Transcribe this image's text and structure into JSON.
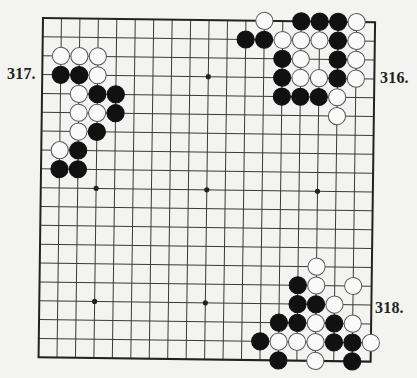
{
  "diagram": {
    "type": "go-board",
    "size": 19,
    "colors": {
      "background": "#f3f3f1",
      "line": "#3a3a3a",
      "border": "#222222",
      "black_stone": "#111111",
      "white_stone": "#fafafa",
      "white_outline": "#555555"
    },
    "hoshi": [
      [
        3,
        9
      ],
      [
        9,
        3
      ],
      [
        9,
        9
      ],
      [
        15,
        9
      ],
      [
        3,
        15
      ],
      [
        9,
        15
      ]
    ],
    "problems": [
      {
        "label": "317.",
        "position": "top-left",
        "stones": [
          {
            "c": 1,
            "r": 2,
            "color": "white"
          },
          {
            "c": 2,
            "r": 2,
            "color": "white"
          },
          {
            "c": 3,
            "r": 2,
            "color": "white"
          },
          {
            "c": 1,
            "r": 3,
            "color": "black"
          },
          {
            "c": 2,
            "r": 3,
            "color": "black"
          },
          {
            "c": 3,
            "r": 3,
            "color": "white"
          },
          {
            "c": 2,
            "r": 4,
            "color": "white"
          },
          {
            "c": 3,
            "r": 4,
            "color": "black"
          },
          {
            "c": 4,
            "r": 4,
            "color": "black"
          },
          {
            "c": 2,
            "r": 5,
            "color": "white"
          },
          {
            "c": 3,
            "r": 5,
            "color": "white"
          },
          {
            "c": 4,
            "r": 5,
            "color": "black"
          },
          {
            "c": 2,
            "r": 6,
            "color": "white"
          },
          {
            "c": 3,
            "r": 6,
            "color": "black"
          },
          {
            "c": 1,
            "r": 7,
            "color": "white"
          },
          {
            "c": 2,
            "r": 7,
            "color": "black"
          },
          {
            "c": 1,
            "r": 8,
            "color": "black"
          },
          {
            "c": 2,
            "r": 8,
            "color": "black"
          }
        ]
      },
      {
        "label": "316.",
        "position": "top-right",
        "stones": [
          {
            "c": 12,
            "r": 0,
            "color": "white"
          },
          {
            "c": 14,
            "r": 0,
            "color": "black"
          },
          {
            "c": 15,
            "r": 0,
            "color": "black"
          },
          {
            "c": 16,
            "r": 0,
            "color": "black"
          },
          {
            "c": 17,
            "r": 0,
            "color": "white"
          },
          {
            "c": 11,
            "r": 1,
            "color": "black"
          },
          {
            "c": 12,
            "r": 1,
            "color": "black"
          },
          {
            "c": 13,
            "r": 1,
            "color": "white"
          },
          {
            "c": 14,
            "r": 1,
            "color": "white"
          },
          {
            "c": 15,
            "r": 1,
            "color": "white"
          },
          {
            "c": 16,
            "r": 1,
            "color": "black"
          },
          {
            "c": 17,
            "r": 1,
            "color": "white"
          },
          {
            "c": 13,
            "r": 2,
            "color": "black"
          },
          {
            "c": 14,
            "r": 2,
            "color": "white"
          },
          {
            "c": 16,
            "r": 2,
            "color": "black"
          },
          {
            "c": 17,
            "r": 2,
            "color": "white"
          },
          {
            "c": 13,
            "r": 3,
            "color": "black"
          },
          {
            "c": 14,
            "r": 3,
            "color": "white"
          },
          {
            "c": 15,
            "r": 3,
            "color": "white"
          },
          {
            "c": 16,
            "r": 3,
            "color": "black"
          },
          {
            "c": 17,
            "r": 3,
            "color": "white"
          },
          {
            "c": 13,
            "r": 4,
            "color": "black"
          },
          {
            "c": 14,
            "r": 4,
            "color": "black"
          },
          {
            "c": 15,
            "r": 4,
            "color": "black"
          },
          {
            "c": 16,
            "r": 4,
            "color": "white"
          },
          {
            "c": 16,
            "r": 5,
            "color": "white"
          }
        ]
      },
      {
        "label": "318.",
        "position": "bottom-right",
        "stones": [
          {
            "c": 15,
            "r": 13,
            "color": "white"
          },
          {
            "c": 14,
            "r": 14,
            "color": "black"
          },
          {
            "c": 15,
            "r": 14,
            "color": "white"
          },
          {
            "c": 17,
            "r": 14,
            "color": "white"
          },
          {
            "c": 14,
            "r": 15,
            "color": "black"
          },
          {
            "c": 15,
            "r": 15,
            "color": "black"
          },
          {
            "c": 16,
            "r": 15,
            "color": "white"
          },
          {
            "c": 13,
            "r": 16,
            "color": "black"
          },
          {
            "c": 14,
            "r": 16,
            "color": "black"
          },
          {
            "c": 15,
            "r": 16,
            "color": "white"
          },
          {
            "c": 16,
            "r": 16,
            "color": "black"
          },
          {
            "c": 17,
            "r": 16,
            "color": "white"
          },
          {
            "c": 12,
            "r": 17,
            "color": "black"
          },
          {
            "c": 13,
            "r": 17,
            "color": "white"
          },
          {
            "c": 14,
            "r": 17,
            "color": "white"
          },
          {
            "c": 15,
            "r": 17,
            "color": "white"
          },
          {
            "c": 16,
            "r": 17,
            "color": "black"
          },
          {
            "c": 17,
            "r": 17,
            "color": "black"
          },
          {
            "c": 18,
            "r": 17,
            "color": "white"
          },
          {
            "c": 13,
            "r": 18,
            "color": "black"
          },
          {
            "c": 15,
            "r": 18,
            "color": "white"
          },
          {
            "c": 17,
            "r": 18,
            "color": "black"
          }
        ]
      }
    ]
  }
}
